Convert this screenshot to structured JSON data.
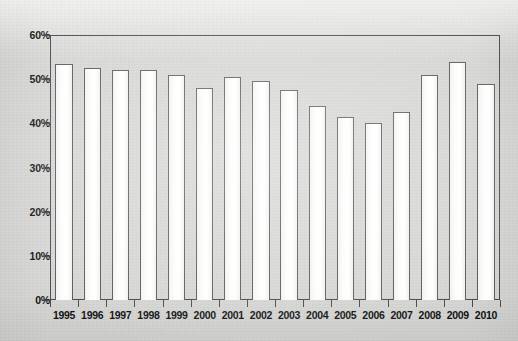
{
  "chart_data": {
    "type": "bar",
    "title": "",
    "xlabel": "",
    "ylabel": "",
    "categories": [
      "1995",
      "1996",
      "1997",
      "1998",
      "1999",
      "2000",
      "2001",
      "2002",
      "2003",
      "2004",
      "2005",
      "2006",
      "2007",
      "2008",
      "2009",
      "2010"
    ],
    "values": [
      53.5,
      52.5,
      52.0,
      52.0,
      51.0,
      48.0,
      50.5,
      49.5,
      47.5,
      44.0,
      41.5,
      40.0,
      42.5,
      51.0,
      54.0,
      49.0
    ],
    "ylim": [
      0,
      60
    ],
    "ytick_labels": [
      "0%",
      "10%",
      "20%",
      "30%",
      "40%",
      "50%",
      "60%"
    ],
    "ytick_values": [
      0,
      10,
      20,
      30,
      40,
      50,
      60
    ],
    "grid": false,
    "legend": null,
    "series": [
      {
        "name": "",
        "values": [
          53.5,
          52.5,
          52.0,
          52.0,
          51.0,
          48.0,
          50.5,
          49.5,
          47.5,
          44.0,
          41.5,
          40.0,
          42.5,
          51.0,
          54.0,
          49.0
        ]
      }
    ]
  },
  "style": {
    "background_color": "#d6d6d4",
    "bar_fill_color": "#ffffff",
    "bar_border_color": "#5a5a5a",
    "axis_color": "#4a4a4a",
    "label_color": "#111111"
  }
}
